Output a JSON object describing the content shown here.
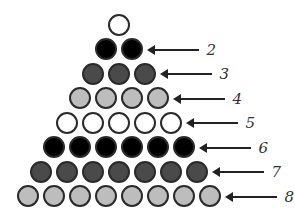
{
  "diagram": {
    "colors": {
      "white": "#ffffff",
      "black": "#000000",
      "dark": "#4a4a4a",
      "light": "#bdbdbd",
      "outline": "#2a2a2a"
    },
    "rows": [
      {
        "row": 1,
        "count": 1,
        "color": "white",
        "label": ""
      },
      {
        "row": 2,
        "count": 2,
        "color": "black",
        "label": "2"
      },
      {
        "row": 3,
        "count": 3,
        "color": "dark",
        "label": "3"
      },
      {
        "row": 4,
        "count": 4,
        "color": "light",
        "label": "4"
      },
      {
        "row": 5,
        "count": 5,
        "color": "white",
        "label": "5"
      },
      {
        "row": 6,
        "count": 6,
        "color": "black",
        "label": "6"
      },
      {
        "row": 7,
        "count": 7,
        "color": "dark",
        "label": "7"
      },
      {
        "row": 8,
        "count": 8,
        "color": "light",
        "label": "8"
      }
    ]
  }
}
